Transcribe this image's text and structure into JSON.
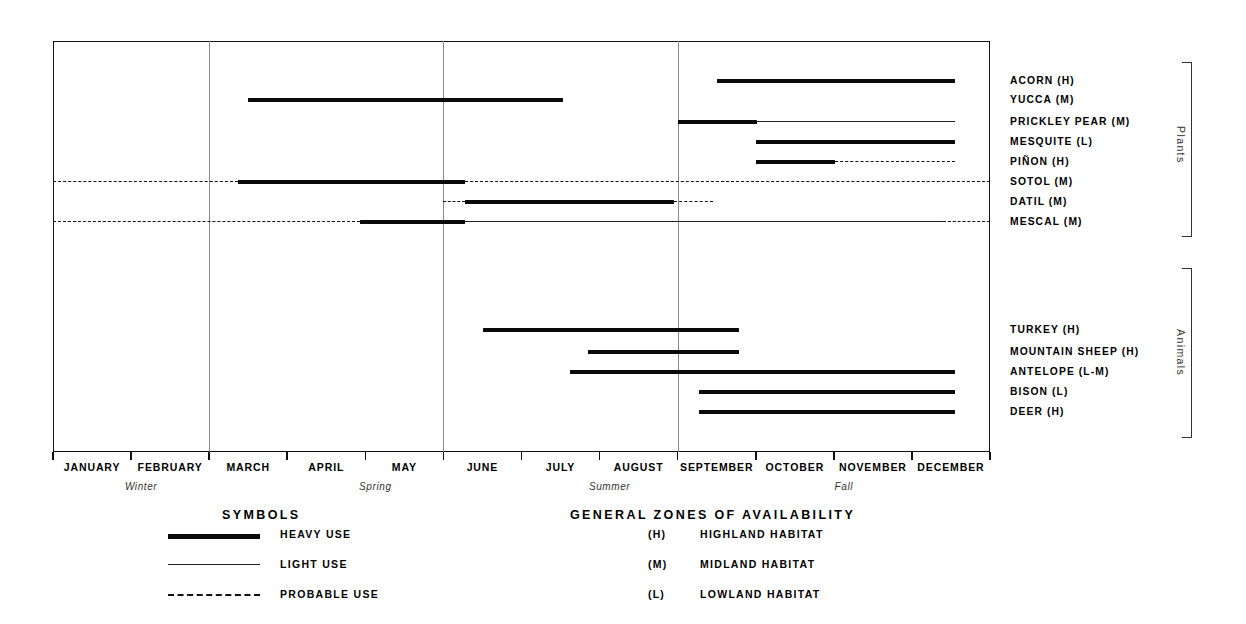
{
  "chart_data": {
    "type": "bar",
    "xlabel": "",
    "ylabel": "",
    "grid": true,
    "x_axis": {
      "categories": [
        "JANUARY",
        "FEBRUARY",
        "MARCH",
        "APRIL",
        "MAY",
        "JUNE",
        "JULY",
        "AUGUST",
        "SEPTEMBER",
        "OCTOBER",
        "NOVEMBER",
        "DECEMBER"
      ],
      "range_months": [
        1,
        13
      ],
      "gridline_months": [
        3,
        6,
        9
      ]
    },
    "seasons": [
      {
        "label": "Winter",
        "center_month": 2.0
      },
      {
        "label": "Spring",
        "center_month": 5.0
      },
      {
        "label": "Summer",
        "center_month": 8.0
      },
      {
        "label": "Fall",
        "center_month": 11.0
      }
    ],
    "groups": [
      {
        "name": "Plants",
        "rows": [
          0,
          1,
          2,
          3,
          4,
          5,
          6,
          7
        ]
      },
      {
        "name": "Animals",
        "rows": [
          8,
          9,
          10,
          11,
          12
        ]
      }
    ],
    "series": [
      {
        "name": "ACORN (H)",
        "group": "Plants",
        "habitat": "H",
        "segments": [
          {
            "use": "heavy",
            "start": 9.5,
            "end": 12.55
          }
        ]
      },
      {
        "name": "YUCCA (M)",
        "group": "Plants",
        "habitat": "M",
        "segments": [
          {
            "use": "heavy",
            "start": 3.5,
            "end": 7.53
          }
        ]
      },
      {
        "name": "PRICKLEY PEAR (M)",
        "group": "Plants",
        "habitat": "M",
        "segments": [
          {
            "use": "heavy",
            "start": 9.0,
            "end": 10.02
          },
          {
            "use": "light",
            "start": 10.02,
            "end": 12.55
          }
        ]
      },
      {
        "name": "MESQUITE (L)",
        "group": "Plants",
        "habitat": "L",
        "segments": [
          {
            "use": "heavy",
            "start": 10.0,
            "end": 12.55
          }
        ]
      },
      {
        "name": "PIÑON (H)",
        "group": "Plants",
        "habitat": "H",
        "segments": [
          {
            "use": "heavy",
            "start": 10.0,
            "end": 11.02
          },
          {
            "use": "probable",
            "start": 11.02,
            "end": 12.55
          }
        ]
      },
      {
        "name": "SOTOL (M)",
        "group": "Plants",
        "habitat": "M",
        "segments": [
          {
            "use": "probable",
            "start": 1.0,
            "end": 3.37
          },
          {
            "use": "heavy",
            "start": 3.37,
            "end": 6.28
          },
          {
            "use": "probable",
            "start": 6.28,
            "end": 13.0
          }
        ]
      },
      {
        "name": "DATIL (M)",
        "group": "Plants",
        "habitat": "M",
        "segments": [
          {
            "use": "probable",
            "start": 6.0,
            "end": 6.28
          },
          {
            "use": "heavy",
            "start": 6.28,
            "end": 8.95
          },
          {
            "use": "probable",
            "start": 8.95,
            "end": 9.45
          }
        ]
      },
      {
        "name": "MESCAL (M)",
        "group": "Plants",
        "habitat": "M",
        "segments": [
          {
            "use": "probable",
            "start": 1.0,
            "end": 4.93
          },
          {
            "use": "heavy",
            "start": 4.93,
            "end": 6.28
          },
          {
            "use": "light",
            "start": 6.28,
            "end": 12.4
          },
          {
            "use": "probable",
            "start": 12.4,
            "end": 13.0
          }
        ]
      },
      {
        "name": "TURKEY (H)",
        "group": "Animals",
        "habitat": "H",
        "segments": [
          {
            "use": "heavy",
            "start": 6.5,
            "end": 9.78
          }
        ]
      },
      {
        "name": "MOUNTAIN SHEEP (H)",
        "group": "Animals",
        "habitat": "H",
        "segments": [
          {
            "use": "heavy",
            "start": 7.85,
            "end": 9.78
          }
        ]
      },
      {
        "name": "ANTELOPE (L-M)",
        "group": "Animals",
        "habitat": "L-M",
        "segments": [
          {
            "use": "heavy",
            "start": 7.62,
            "end": 12.55
          }
        ]
      },
      {
        "name": "BISON (L)",
        "group": "Animals",
        "habitat": "L",
        "segments": [
          {
            "use": "heavy",
            "start": 9.27,
            "end": 12.55
          }
        ]
      },
      {
        "name": "DEER (H)",
        "group": "Animals",
        "habitat": "H",
        "segments": [
          {
            "use": "heavy",
            "start": 9.27,
            "end": 12.55
          }
        ]
      }
    ]
  },
  "symbols_legend": {
    "title": "SYMBOLS",
    "entries": [
      {
        "style": "heavy",
        "label": "HEAVY USE"
      },
      {
        "style": "light",
        "label": "LIGHT USE"
      },
      {
        "style": "probable",
        "label": "PROBABLE USE"
      }
    ]
  },
  "zones_legend": {
    "title": "GENERAL ZONES OF AVAILABILITY",
    "entries": [
      {
        "code": "(H)",
        "label": "HIGHLAND  HABITAT"
      },
      {
        "code": "(M)",
        "label": "MIDLAND  HABITAT"
      },
      {
        "code": "(L)",
        "label": "LOWLAND  HABITAT"
      }
    ]
  },
  "colors": {
    "ink": "#0a0a0a",
    "grid": "#8a8a8a",
    "paper": "#ffffff",
    "muted": "#333333"
  }
}
